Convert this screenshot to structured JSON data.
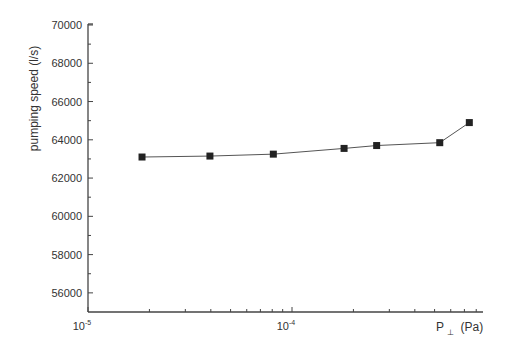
{
  "chart_data": {
    "type": "line",
    "title": "",
    "xlabel": "P",
    "xlabel_subscript": "⊥",
    "xlabel_unit": "(Pa)",
    "ylabel": "pumping speed (l/s)",
    "x_scale": "log",
    "xlim": [
      1e-05,
      0.001
    ],
    "ylim": [
      55000,
      70000
    ],
    "x_ticks": [
      {
        "value": 1e-05,
        "base": "10",
        "exp": "-5"
      },
      {
        "value": 0.0001,
        "base": "10",
        "exp": "-4"
      }
    ],
    "y_ticks": [
      56000,
      58000,
      60000,
      62000,
      64000,
      66000,
      68000,
      70000
    ],
    "y_tick_labels": [
      "56000",
      "58000",
      "60000",
      "62000",
      "64000",
      "66000",
      "68000",
      "70000"
    ],
    "y_minor_step": 1000,
    "grid": false,
    "legend": "none",
    "series": [
      {
        "name": "pumping speed",
        "marker": "square",
        "color": "#222222",
        "line_color": "#555555",
        "x": [
          1.84e-05,
          3.96e-05,
          8.1e-05,
          0.00018,
          0.00026,
          0.00053,
          0.00074
        ],
        "y": [
          63100,
          63150,
          63250,
          63550,
          63700,
          63850,
          64900
        ]
      }
    ]
  },
  "colors": {
    "axis": "#444444",
    "text": "#333333"
  }
}
